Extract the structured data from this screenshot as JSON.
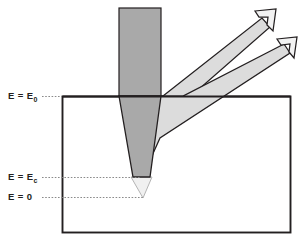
{
  "figure": {
    "type": "diagram",
    "background_color": "#ffffff"
  },
  "labels": [
    {
      "id": "e0",
      "text_main": "E = E",
      "subscript": "0",
      "value_label": "E = E0",
      "y_px": 96
    },
    {
      "id": "ec",
      "text_main": "E = E",
      "subscript": "c",
      "value_label": "E = Ec",
      "y_px": 177
    },
    {
      "id": "e00",
      "text_main": "E = 0",
      "subscript": "",
      "value_label": "E = 0",
      "y_px": 197
    }
  ],
  "colors": {
    "specimen_border": "#231f20",
    "specimen_fill": "#ffffff",
    "incident_beam_fill": "#a9a9a9",
    "beam_tip_fill": "#e8e8e8",
    "emission_fill": "#dcdcdc",
    "outline": "#231f20",
    "leader_line": "#8a8a8a"
  },
  "geometry": {
    "specimen_box": {
      "x": 62,
      "y": 96,
      "width": 228,
      "height": 137
    },
    "incident_beam": {
      "left": 119,
      "right": 161,
      "top": 8
    },
    "beam_apex_ec": {
      "x": 141,
      "y": 177
    },
    "beam_apex_zero": {
      "x": 143,
      "y": 197
    },
    "arrow_upper_tip": {
      "x": 268,
      "y": 14
    },
    "arrow_lower_tip": {
      "x": 290,
      "y": 42
    }
  }
}
